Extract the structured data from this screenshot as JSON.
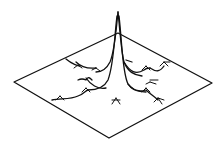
{
  "figure": {
    "colors": {
      "line": "#111111",
      "background": "#ffffff"
    },
    "plane": {
      "left": [
        14,
        82
      ],
      "top": [
        118,
        33
      ],
      "right": [
        212,
        83
      ],
      "bottom": [
        109,
        138
      ]
    },
    "peak": {
      "tip": [
        118,
        12
      ]
    }
  }
}
